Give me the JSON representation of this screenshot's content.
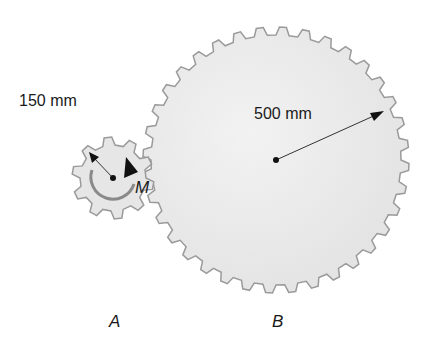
{
  "diagram": {
    "gear_a": {
      "label": "A",
      "radius_label": "150 mm",
      "moment_label": "M",
      "center": [
        113,
        178
      ],
      "outer_radius": 41,
      "teeth": 10,
      "fill": "#e6e6e6",
      "stroke": "#9a9a9a"
    },
    "gear_b": {
      "label": "B",
      "radius_label": "500 mm",
      "center": [
        276,
        160
      ],
      "outer_radius": 133,
      "teeth": 36,
      "fill": "#e9e9e9",
      "stroke": "#9a9a9a"
    }
  }
}
